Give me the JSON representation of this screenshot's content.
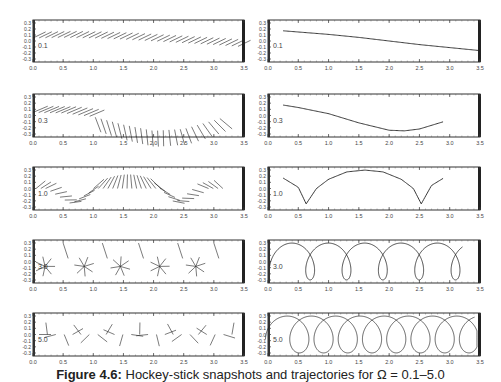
{
  "figure": {
    "caption_label": "Figure 4.6:",
    "caption_text": "Hockey-stick snapshots and trajectories for Ω = 0.1–5.0",
    "x_ticks": [
      "0.0",
      "0.5",
      "1.0",
      "1.5",
      "2.0",
      "2.5",
      "3.0",
      "3.5"
    ],
    "y_ticks": [
      "0.3",
      "0.2",
      "0.1",
      "0.0",
      "-0.1",
      "-0.2",
      "-0.3"
    ]
  },
  "chart_data": [
    {
      "type": "line",
      "panel": "left-row1",
      "label": "0.1",
      "xlim": [
        0,
        3.5
      ],
      "ylim": [
        -0.35,
        0.35
      ],
      "description": "stroboscopic stick segments along path",
      "x": [
        0.0,
        0.5,
        1.0,
        1.5,
        2.0,
        2.5,
        3.0,
        3.4
      ],
      "y": [
        0.05,
        0.06,
        0.05,
        0.03,
        0.0,
        -0.03,
        -0.06,
        -0.09
      ]
    },
    {
      "type": "line",
      "panel": "right-row1",
      "label": "0.1",
      "xlim": [
        0,
        3.5
      ],
      "ylim": [
        -0.35,
        0.35
      ],
      "x": [
        0.25,
        1.0,
        1.5,
        2.0,
        2.5,
        3.0,
        3.5
      ],
      "y": [
        0.17,
        0.11,
        0.06,
        0.0,
        -0.06,
        -0.11,
        -0.16
      ]
    },
    {
      "type": "line",
      "panel": "left-row2",
      "label": "0.3",
      "xlim": [
        0,
        3.5
      ],
      "ylim": [
        -0.35,
        0.35
      ],
      "x": [
        0.0,
        0.5,
        1.0,
        1.5,
        2.0,
        2.5,
        3.1
      ],
      "y": [
        0.05,
        0.04,
        -0.02,
        -0.15,
        -0.25,
        -0.22,
        -0.05
      ]
    },
    {
      "type": "line",
      "panel": "right-row2",
      "label": "0.3",
      "xlim": [
        0,
        3.5
      ],
      "ylim": [
        -0.35,
        0.35
      ],
      "x": [
        0.25,
        0.5,
        1.0,
        1.5,
        2.0,
        2.25,
        2.5,
        2.9
      ],
      "y": [
        0.17,
        0.13,
        0.03,
        -0.12,
        -0.24,
        -0.25,
        -0.22,
        -0.1
      ]
    },
    {
      "type": "line",
      "panel": "left-row3",
      "label": "1.0",
      "xlim": [
        0,
        3.5
      ],
      "ylim": [
        -0.35,
        0.35
      ],
      "x": [
        0.0,
        0.63,
        1.0,
        1.6,
        2.2,
        2.53,
        3.1
      ],
      "y": [
        0.1,
        -0.25,
        0.05,
        0.3,
        0.05,
        -0.25,
        0.1
      ]
    },
    {
      "type": "line",
      "panel": "right-row3",
      "label": "1.0",
      "xlim": [
        0,
        3.5
      ],
      "ylim": [
        -0.35,
        0.35
      ],
      "x": [
        0.25,
        0.5,
        0.63,
        0.8,
        1.0,
        1.3,
        1.6,
        1.9,
        2.2,
        2.4,
        2.53,
        2.7,
        2.9
      ],
      "y": [
        0.17,
        0.02,
        -0.25,
        0.0,
        0.15,
        0.27,
        0.3,
        0.27,
        0.15,
        0.0,
        -0.25,
        0.05,
        0.17
      ]
    },
    {
      "type": "line",
      "panel": "left-row4",
      "label": "3.0",
      "xlim": [
        0,
        3.5
      ],
      "ylim": [
        -0.35,
        0.35
      ],
      "description": "stick snapshots clustered near 5 loops",
      "x": [
        0.2,
        0.85,
        1.45,
        2.1,
        2.7
      ],
      "y": [
        -0.1,
        -0.1,
        -0.1,
        -0.1,
        -0.05
      ]
    },
    {
      "type": "line",
      "panel": "right-row4",
      "label": "3.0",
      "xlim": [
        0,
        3.5
      ],
      "ylim": [
        -0.35,
        0.35
      ],
      "description": "looping trajectory with 5 loops",
      "loop_centers_x": [
        0.25,
        0.85,
        1.45,
        2.1,
        2.7
      ],
      "y_top": 0.3,
      "y_bottom": -0.3
    },
    {
      "type": "line",
      "panel": "left-row5",
      "label": "5.0",
      "xlim": [
        0,
        3.5
      ],
      "ylim": [
        -0.35,
        0.35
      ],
      "description": "stick snapshots scattered",
      "x": [
        0.2,
        0.7,
        1.1,
        1.6,
        2.1,
        2.6,
        3.1
      ],
      "y": [
        0.0,
        0.0,
        0.0,
        0.0,
        0.0,
        0.0,
        0.0
      ]
    },
    {
      "type": "line",
      "panel": "right-row5",
      "label": "5.0",
      "xlim": [
        0,
        3.5
      ],
      "ylim": [
        -0.35,
        0.35
      ],
      "description": "looping trajectory with 8 overlapping loops",
      "loop_centers_x": [
        0.35,
        0.75,
        1.15,
        1.55,
        1.95,
        2.35,
        2.75,
        3.2
      ],
      "y_top": 0.3,
      "y_bottom": -0.3
    }
  ]
}
